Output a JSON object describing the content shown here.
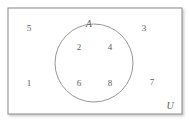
{
  "figure": {
    "kind": "venn-diagram",
    "background_color": "#ffffff",
    "stroke_color": "#8a8a8a",
    "text_color": "#5c5c5c"
  },
  "universe": {
    "label": "U",
    "shape": "rectangle",
    "rect": {
      "x": 8,
      "y": 8,
      "width": 174,
      "height": 106
    },
    "label_position": {
      "x": 170,
      "y": 106
    }
  },
  "sets": [
    {
      "label": "A",
      "shape": "circle",
      "circle": {
        "cx": 94,
        "cy": 63,
        "r": 39
      },
      "label_position": {
        "x": 89,
        "y": 25
      }
    }
  ],
  "elements": [
    {
      "value": "5",
      "region": "outside-A",
      "x": 29,
      "y": 28
    },
    {
      "value": "3",
      "region": "outside-A",
      "x": 144,
      "y": 28
    },
    {
      "value": "2",
      "region": "inside-A",
      "x": 79,
      "y": 47
    },
    {
      "value": "4",
      "region": "inside-A",
      "x": 110,
      "y": 47
    },
    {
      "value": "6",
      "region": "inside-A",
      "x": 79,
      "y": 83
    },
    {
      "value": "8",
      "region": "inside-A",
      "x": 110,
      "y": 83
    },
    {
      "value": "1",
      "region": "outside-A",
      "x": 29,
      "y": 83
    },
    {
      "value": "7",
      "region": "outside-A",
      "x": 152,
      "y": 82
    }
  ]
}
